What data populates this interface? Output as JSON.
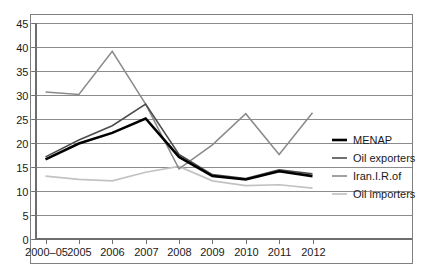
{
  "chart_data": {
    "type": "line",
    "title": "",
    "subtitle": "",
    "xlabel": "",
    "ylabel": "",
    "x": [
      "2000–05",
      "2005",
      "2006",
      "2007",
      "2008",
      "2009",
      "2010",
      "2011",
      "2012"
    ],
    "categories": [
      "2000–05",
      "2005",
      "2006",
      "2007",
      "2008",
      "2009",
      "2010",
      "2011",
      "2012"
    ],
    "ylim": [
      0,
      45
    ],
    "ytick_step": 5,
    "yticks": [
      0,
      5,
      10,
      15,
      20,
      25,
      30,
      35,
      40,
      45
    ],
    "ytick_labels": [
      "0",
      "5",
      "10",
      "15",
      "20",
      "25",
      "30",
      "35",
      "40",
      "45"
    ],
    "grid": true,
    "grid_axis": "y",
    "legend_position": "right",
    "series": [
      {
        "name": "MENAP",
        "color": "#000000",
        "width": 2.6,
        "values": [
          16.5,
          19.8,
          22.0,
          25.0,
          17.0,
          13.0,
          12.3,
          14.0,
          13.0
        ]
      },
      {
        "name": "Oil exporters",
        "color": "#4d4d4d",
        "width": 1.6,
        "values": [
          17.0,
          20.5,
          23.5,
          28.0,
          17.5,
          13.3,
          12.5,
          14.3,
          13.5
        ]
      },
      {
        "name": "Iran.I.R.of",
        "color": "#8a8a8a",
        "width": 1.5,
        "values": [
          30.5,
          30.0,
          39.0,
          28.0,
          14.5,
          19.5,
          26.0,
          17.5,
          26.2
        ]
      },
      {
        "name": "Oil importers",
        "color": "#c2c2c2",
        "width": 1.7,
        "values": [
          13.0,
          12.3,
          12.0,
          13.8,
          15.0,
          12.0,
          11.0,
          11.2,
          10.5
        ]
      }
    ]
  },
  "legend": {
    "entries": [
      {
        "label": "MENAP"
      },
      {
        "label": "Oil exporters"
      },
      {
        "label": "Iran.I.R.of"
      },
      {
        "label": "Oil importers"
      }
    ]
  }
}
